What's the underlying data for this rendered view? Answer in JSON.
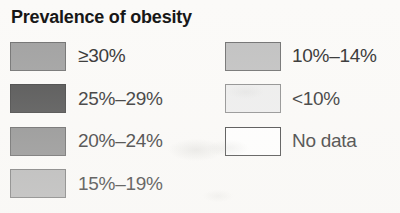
{
  "legend": {
    "title": "Prevalence of obesity",
    "columns": [
      {
        "name": "left-column",
        "items": [
          {
            "label": "≥30%",
            "color": "#9e9e9e",
            "border": "#6e6e6e"
          },
          {
            "label": "25%–29%",
            "color": "#4a4a4a",
            "border": "#3c3c3c"
          },
          {
            "label": "20%–24%",
            "color": "#8a8a8a",
            "border": "#5e5e5e"
          },
          {
            "label": "15%–19%",
            "color": "#b0b0b0",
            "border": "#6e6e6e"
          }
        ]
      },
      {
        "name": "right-column",
        "items": [
          {
            "label": "10%–14%",
            "color": "#c0c0c0",
            "border": "#6e6e6e"
          },
          {
            "label": "<10%",
            "color": "#ededed",
            "border": "#8a8a8a"
          },
          {
            "label": "No data",
            "color": "#ffffff",
            "border": "#3c3c3c"
          }
        ]
      }
    ]
  }
}
